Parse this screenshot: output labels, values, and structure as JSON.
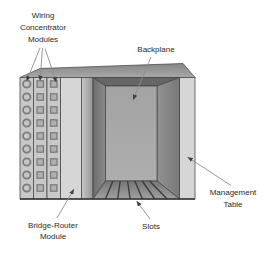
{
  "diagram": {
    "labels": {
      "wiring_concentrator_modules": {
        "lines": [
          "Wiring",
          "Concentrator",
          "Modules"
        ]
      },
      "backplane": {
        "text": "Backplane"
      },
      "bridge_router_module": {
        "lines": [
          "Bridge-Router",
          "Module"
        ]
      },
      "slots": {
        "text": "Slots"
      },
      "management_table": {
        "lines": [
          "Management",
          "Table"
        ]
      }
    },
    "modules": [
      {
        "name": "wiring-concentrator-module-1",
        "port_icon": "circle-port-icon",
        "port_count": 9
      },
      {
        "name": "wiring-concentrator-module-2",
        "port_icon": "square-port-icon",
        "port_count": 9
      },
      {
        "name": "wiring-concentrator-module-3",
        "port_icon": "square-port-icon",
        "port_count": 9
      }
    ],
    "colors": {
      "background": "#ffffff",
      "chassis_light_panel": "#d6d6d6",
      "module_strip": "#c8c8c8",
      "top_face": "#9a9a9a",
      "interior_wall": "#7e7e7e",
      "backplane_panel": "#a9a9a9",
      "floor": "#8f8f8f",
      "outline": "#3f3f3f",
      "label_text": "#2a2a2a",
      "arrow_line": "#8c8c8c",
      "arrowhead": "#3c3c3c"
    }
  }
}
